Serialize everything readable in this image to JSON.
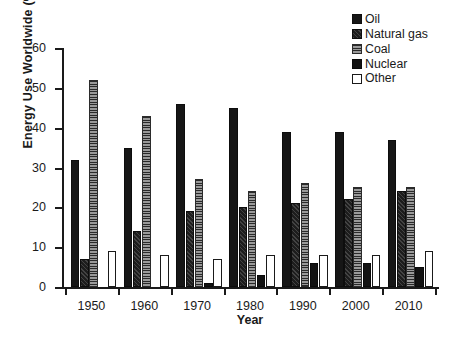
{
  "chart_data": {
    "type": "bar",
    "title": "",
    "xlabel": "Year",
    "ylabel": "Energy Use Worldwide (%)",
    "categories": [
      "1950",
      "1960",
      "1970",
      "1980",
      "1990",
      "2000",
      "2010"
    ],
    "ylim": [
      0,
      60
    ],
    "yticks": [
      0,
      10,
      20,
      30,
      40,
      50,
      60
    ],
    "grid": false,
    "legend_position": "top-right",
    "series": [
      {
        "name": "Oil",
        "fill": "solid-black",
        "color": "#161616",
        "values": [
          32,
          35,
          46,
          45,
          39,
          39,
          37
        ]
      },
      {
        "name": "Natural gas",
        "fill": "diagonal-hatch",
        "color": "#1d1d1d",
        "values": [
          7,
          14,
          19,
          20,
          21,
          22,
          24
        ]
      },
      {
        "name": "Coal",
        "fill": "horizontal-hatch",
        "color": "#6f6f6f",
        "values": [
          52,
          43,
          27,
          24,
          26,
          25,
          25
        ]
      },
      {
        "name": "Nuclear",
        "fill": "solid-black",
        "color": "#121212",
        "values": [
          0,
          0,
          1,
          3,
          6,
          6,
          5
        ]
      },
      {
        "name": "Other",
        "fill": "white-outline",
        "color": "#ffffff",
        "values": [
          9,
          8,
          7,
          8,
          8,
          8,
          9
        ]
      }
    ]
  },
  "legend": {
    "items": [
      {
        "label": "Oil"
      },
      {
        "label": "Natural gas"
      },
      {
        "label": "Coal"
      },
      {
        "label": "Nuclear"
      },
      {
        "label": "Other"
      }
    ]
  }
}
